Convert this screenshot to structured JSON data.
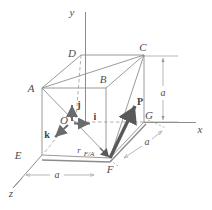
{
  "figure": {
    "type": "3d-vector-diagram",
    "colors": {
      "edge": "#8c8c8c",
      "hidden_edge": "#a6a6a6",
      "axis": "#8c8c8c",
      "vector": "#595959",
      "unit_vector": "#6b6b6b",
      "dimension": "#9a9a9a",
      "label": "#4d4d4d",
      "background": "#ffffff"
    }
  },
  "axes": [
    {
      "name": "y-axis",
      "label": "y",
      "x": 72,
      "y": 14
    },
    {
      "name": "x-axis",
      "label": "x",
      "x": 198,
      "y": 134
    },
    {
      "name": "z-axis",
      "label": "z",
      "x": 10,
      "y": 196
    }
  ],
  "vertices": [
    {
      "name": "A",
      "label": "A",
      "x": 31,
      "y": 91,
      "px": 42,
      "py": 88
    },
    {
      "name": "B",
      "label": "B",
      "x": 101,
      "y": 84,
      "px": 106,
      "py": 88
    },
    {
      "name": "C",
      "label": "C",
      "x": 141,
      "y": 51,
      "px": 144,
      "py": 55
    },
    {
      "name": "D",
      "label": "D",
      "x": 70,
      "y": 57,
      "px": 81,
      "py": 55
    },
    {
      "name": "E",
      "label": "E",
      "x": 17,
      "y": 158,
      "px": 42,
      "py": 155
    },
    {
      "name": "F",
      "label": "F",
      "x": 108,
      "y": 172,
      "px": 110,
      "py": 158
    },
    {
      "name": "G",
      "label": "G",
      "x": 146,
      "y": 124,
      "px": 144,
      "py": 122
    },
    {
      "name": "O",
      "label": "O",
      "x": 64,
      "y": 124,
      "px": 70,
      "py": 122
    }
  ],
  "unit_vectors": [
    {
      "name": "i-unit-vector",
      "label": "i",
      "lx": 95,
      "ly": 121,
      "x1": 73,
      "y1": 123,
      "x2": 92,
      "y2": 123
    },
    {
      "name": "j-unit-vector",
      "label": "j",
      "lx": 78,
      "ly": 108,
      "x1": 72,
      "y1": 122,
      "x2": 72,
      "y2": 103
    },
    {
      "name": "k-unit-vector",
      "label": "k",
      "lx": 48,
      "ly": 138,
      "x1": 69,
      "y1": 124,
      "x2": 53,
      "y2": 139
    }
  ],
  "force_vector": {
    "name": "force-vector-P",
    "label": "P",
    "lx": 139,
    "ly": 105,
    "x1": 110,
    "y1": 158,
    "x2": 136,
    "y2": 104
  },
  "position_vector": {
    "name": "position-vector-r",
    "label": "r",
    "sub": "F/A",
    "lx": 79,
    "ly": 152,
    "sub_x": 84,
    "sub_y": 155
  },
  "dimensions": [
    {
      "name": "dimension-a-right",
      "label": "a",
      "lx": 160,
      "ly": 94,
      "orientation": "vertical"
    },
    {
      "name": "dimension-a-bottom",
      "label": "a",
      "lx": 56,
      "ly": 176,
      "orientation": "horizontal"
    },
    {
      "name": "dimension-a-depth",
      "label": "a",
      "lx": 144,
      "ly": 144,
      "orientation": "diagonal"
    }
  ]
}
